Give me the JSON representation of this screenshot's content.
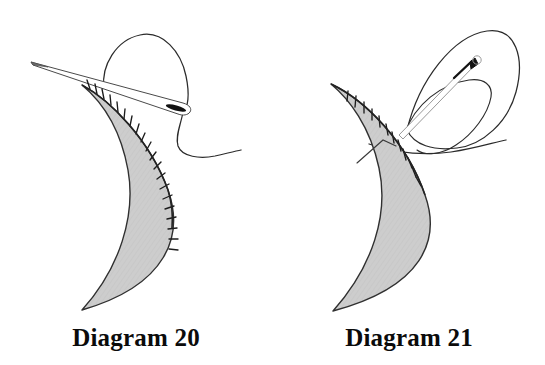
{
  "page": {
    "background_color": "#ffffff",
    "width": 545,
    "height": 365
  },
  "style": {
    "fabric_fill": "#cdcdcd",
    "fabric_stroke": "#303030",
    "thread_stroke": "#2b2b2b",
    "needle_fill": "#ffffff",
    "needle_stroke": "#4a4a4a",
    "needle_eye_fill": "#111111",
    "stitch_stroke": "#1c1c1c",
    "caption_color": "#0b0b0b"
  },
  "panels": [
    {
      "id": "diagram-20",
      "caption": "Diagram 20",
      "description": "Crescent shaped fabric piece with blanket stitching along the inner curved edge; a threaded needle lies across the top with a loop of thread rising above it.",
      "elements": {
        "fabric_label": "crescent fabric piece",
        "needle_label": "sewing needle",
        "thread_label": "working thread loop",
        "stitches_label": "blanket stitch row",
        "stitch_count": 20
      }
    },
    {
      "id": "diagram-21",
      "caption": "Diagram 21",
      "description": "Crescent shaped fabric piece with blanket stitching along the upper curved edge; the needle is pulled up and to the right through a large loop of thread.",
      "elements": {
        "fabric_label": "crescent fabric piece",
        "needle_label": "sewing needle",
        "thread_label": "working thread loop",
        "stitches_label": "blanket stitch row",
        "stitch_count": 12
      }
    }
  ]
}
